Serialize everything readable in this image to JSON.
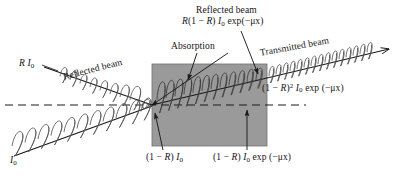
{
  "figure": {
    "type": "optics-ray-diagram",
    "background_color": "#ffffff",
    "line_color": "#1a1a1a",
    "slab_fill_color": "#9a9a9a",
    "slab_border_color": "#6d6d6d"
  },
  "labels": {
    "reflected_top_title": "Reflected beam",
    "reflected_top_formula_parts": {
      "prefix": "R",
      "bracket_open": "(1 − ",
      "r": "R",
      "bracket_close": ")",
      "intensity": "I",
      "intensity_sub": "0",
      "exp": " exp(−μx)"
    },
    "absorption": "Absorption",
    "transmitted_title": "Transmitted beam",
    "transmitted_formula_parts": {
      "bracket_open": "(1 − ",
      "r": "R",
      "bracket_close": ")",
      "power": "2",
      "intensity": " I",
      "intensity_sub": "0",
      "exp": " exp (−μx)"
    },
    "reflected_left_intensity_parts": {
      "r": "R",
      "intensity": " I",
      "intensity_sub": "0"
    },
    "reflected_left_title": "Reflected beam",
    "incident_intensity_parts": {
      "intensity": "I",
      "intensity_sub": "0"
    },
    "front_surface_formula_parts": {
      "bracket_open": "(1 − ",
      "r": "R",
      "bracket_close": ") ",
      "intensity": "I",
      "intensity_sub": "0"
    },
    "back_surface_formula_parts": {
      "bracket_open": "(1 − ",
      "r": "R",
      "bracket_close": ") ",
      "intensity": "I",
      "intensity_sub": "0",
      "exp": " exp (−μx)"
    }
  },
  "geometry": {
    "slab": {
      "x": 152,
      "y": 64,
      "width": 115,
      "height": 82
    },
    "optical_axis_dash": {
      "x1": 5,
      "y1": 105,
      "x2": 306,
      "y2": 105
    }
  }
}
